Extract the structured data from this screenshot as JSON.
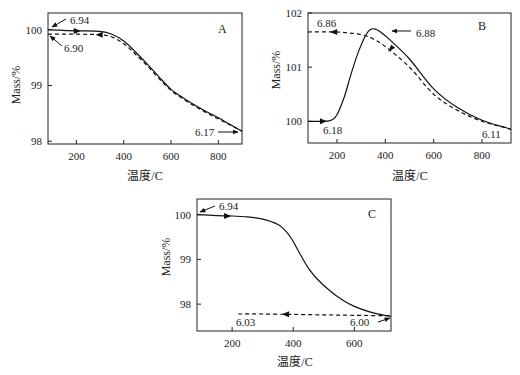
{
  "chart_data": [
    {
      "type": "line",
      "panel": "A",
      "xlabel": "温度/C",
      "ylabel": "Mass/%",
      "xlim": [
        80,
        900
      ],
      "ylim": [
        97.95,
        100.3
      ],
      "xticks": [
        200,
        400,
        600,
        800
      ],
      "yticks": [
        98,
        99,
        100
      ],
      "series": [
        {
          "name": "heating",
          "style": "solid",
          "x": [
            80,
            200,
            300,
            350,
            400,
            450,
            500,
            550,
            600,
            650,
            700,
            750,
            800,
            850,
            900
          ],
          "y": [
            100.0,
            99.98,
            99.97,
            99.92,
            99.8,
            99.6,
            99.38,
            99.15,
            98.93,
            98.78,
            98.65,
            98.53,
            98.42,
            98.3,
            98.18
          ]
        },
        {
          "name": "cooling",
          "style": "dashed",
          "x": [
            80,
            200,
            300,
            350,
            400,
            450,
            500,
            550,
            600,
            650,
            700,
            750,
            800,
            850,
            900
          ],
          "y": [
            99.92,
            99.92,
            99.91,
            99.87,
            99.75,
            99.56,
            99.35,
            99.12,
            98.91,
            98.76,
            98.63,
            98.51,
            98.4,
            98.29,
            98.18
          ]
        }
      ],
      "annotations": [
        {
          "text": "6.94",
          "arrow": "to-start-heating"
        },
        {
          "text": "6.90",
          "arrow": "to-end-cooling"
        },
        {
          "text": "6.17",
          "arrow": "to-end-heating"
        }
      ],
      "direction_arrows": [
        {
          "series": "heating",
          "x": 210,
          "dir": "right"
        },
        {
          "series": "cooling",
          "x": 290,
          "dir": "left"
        }
      ]
    },
    {
      "type": "line",
      "panel": "B",
      "xlabel": "温度/C",
      "ylabel": "Mass/%",
      "xlim": [
        80,
        920
      ],
      "ylim": [
        99.6,
        102.0
      ],
      "xticks": [
        200,
        400,
        600,
        800
      ],
      "yticks": [
        100,
        101,
        102
      ],
      "series": [
        {
          "name": "heating",
          "style": "solid",
          "x": [
            80,
            150,
            180,
            200,
            230,
            260,
            290,
            320,
            340,
            360,
            380,
            420,
            500,
            600,
            700,
            800,
            900,
            920
          ],
          "y": [
            100.0,
            100.0,
            100.03,
            100.12,
            100.45,
            100.9,
            101.3,
            101.6,
            101.7,
            101.7,
            101.65,
            101.5,
            101.15,
            100.6,
            100.25,
            100.02,
            99.88,
            99.85
          ]
        },
        {
          "name": "cooling",
          "style": "dashed",
          "x": [
            80,
            200,
            300,
            350,
            400,
            500,
            600,
            700,
            800,
            900,
            920
          ],
          "y": [
            101.65,
            101.65,
            101.6,
            101.52,
            101.38,
            101.0,
            100.5,
            100.2,
            100.0,
            99.88,
            99.85
          ]
        }
      ],
      "annotations": [
        {
          "text": "6.86",
          "arrow": "none"
        },
        {
          "text": "6.88",
          "arrow": "to-peak-heating"
        },
        {
          "text": "6.18",
          "arrow": "none"
        },
        {
          "text": "6.11",
          "arrow": "none"
        }
      ],
      "direction_arrows": [
        {
          "series": "heating",
          "x": 150,
          "dir": "right"
        },
        {
          "series": "cooling",
          "x": 180,
          "dir": "left"
        },
        {
          "series": "cooling",
          "x": 420,
          "dir": "down-left"
        }
      ]
    },
    {
      "type": "line",
      "panel": "C",
      "xlabel": "温度/C",
      "ylabel": "Mass/%",
      "xlim": [
        85,
        720
      ],
      "ylim": [
        97.4,
        100.35
      ],
      "xticks": [
        200,
        400,
        600
      ],
      "yticks": [
        98,
        99,
        100
      ],
      "series": [
        {
          "name": "heating",
          "style": "solid",
          "x": [
            85,
            150,
            200,
            250,
            300,
            350,
            380,
            400,
            420,
            450,
            480,
            520,
            560,
            600,
            650,
            700,
            720
          ],
          "y": [
            100.0,
            99.98,
            99.97,
            99.95,
            99.9,
            99.78,
            99.6,
            99.4,
            99.15,
            98.8,
            98.55,
            98.3,
            98.1,
            97.95,
            97.83,
            97.75,
            97.73
          ]
        },
        {
          "name": "cooling",
          "style": "dashed",
          "x": [
            220,
            300,
            400,
            500,
            600,
            720
          ],
          "y": [
            97.78,
            97.78,
            97.77,
            97.76,
            97.75,
            97.74
          ]
        }
      ],
      "annotations": [
        {
          "text": "6.94",
          "arrow": "to-start-heating"
        },
        {
          "text": "6.03",
          "arrow": "none"
        },
        {
          "text": "6.00",
          "arrow": "to-end-heating"
        }
      ],
      "direction_arrows": [
        {
          "series": "heating",
          "x": 190,
          "dir": "right"
        },
        {
          "series": "cooling",
          "x": 370,
          "dir": "left"
        }
      ]
    }
  ]
}
